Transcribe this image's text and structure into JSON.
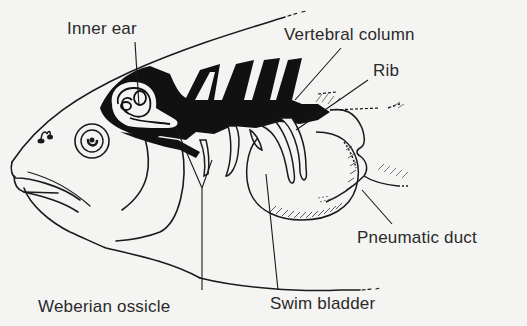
{
  "diagram": {
    "labels": {
      "inner_ear": "Inner ear",
      "vertebral_column": "Vertebral column",
      "rib": "Rib",
      "pneumatic_duct": "Pneumatic duct",
      "weberian_ossicle": "Weberian ossicle",
      "swim_bladder": "Swim bladder"
    },
    "colors": {
      "background": "#f4f4f2",
      "ink": "#1a1a1a",
      "text": "#2a2a2a"
    }
  }
}
